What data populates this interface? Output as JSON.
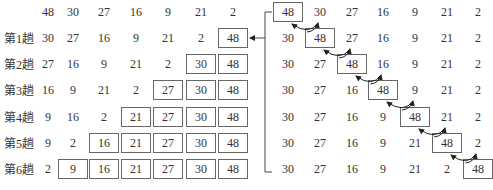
{
  "left_panel": {
    "title": "Bubble sort passes",
    "rows": [
      {
        "label": "",
        "values": [
          "48",
          "30",
          "27",
          "16",
          "9",
          "21",
          "2"
        ],
        "boxed_from": 7
      },
      {
        "label": "第1趟",
        "values": [
          "30",
          "27",
          "16",
          "9",
          "21",
          "2",
          "48"
        ],
        "boxed_from": 6
      },
      {
        "label": "第2趟",
        "values": [
          "27",
          "16",
          "9",
          "21",
          "2",
          "30",
          "48"
        ],
        "boxed_from": 5
      },
      {
        "label": "第3趟",
        "values": [
          "16",
          "9",
          "21",
          "2",
          "27",
          "30",
          "48"
        ],
        "boxed_from": 4
      },
      {
        "label": "第4趟",
        "values": [
          "9",
          "16",
          "2",
          "21",
          "27",
          "30",
          "48"
        ],
        "boxed_from": 3
      },
      {
        "label": "第5趟",
        "values": [
          "9",
          "2",
          "16",
          "21",
          "27",
          "30",
          "48"
        ],
        "boxed_from": 2
      },
      {
        "label": "第6趟",
        "values": [
          "2",
          "9",
          "16",
          "21",
          "27",
          "30",
          "48"
        ],
        "boxed_from": 1
      }
    ]
  },
  "right_panel": {
    "title": "First pass detail",
    "rows": [
      {
        "values": [
          "48",
          "30",
          "27",
          "16",
          "9",
          "21",
          "2"
        ],
        "boxed_index": 0
      },
      {
        "values": [
          "30",
          "48",
          "27",
          "16",
          "9",
          "21",
          "2"
        ],
        "boxed_index": 1
      },
      {
        "values": [
          "30",
          "27",
          "48",
          "16",
          "9",
          "21",
          "2"
        ],
        "boxed_index": 2
      },
      {
        "values": [
          "30",
          "27",
          "16",
          "48",
          "9",
          "21",
          "2"
        ],
        "boxed_index": 3
      },
      {
        "values": [
          "30",
          "27",
          "16",
          "9",
          "48",
          "21",
          "2"
        ],
        "boxed_index": 4
      },
      {
        "values": [
          "30",
          "27",
          "16",
          "9",
          "21",
          "48",
          "2"
        ],
        "boxed_index": 5
      },
      {
        "values": [
          "30",
          "27",
          "16",
          "9",
          "21",
          "2",
          "48"
        ],
        "boxed_index": 6
      }
    ]
  },
  "colors": {
    "text": "#333333",
    "border": "#666666",
    "arrow": "#222222"
  }
}
